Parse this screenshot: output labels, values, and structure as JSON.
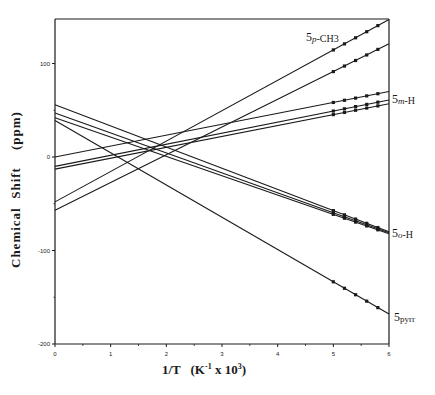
{
  "chart_data": {
    "type": "line",
    "title": "",
    "xlabel": "1/T   (K-1 x 10³)",
    "ylabel": "Chemical  Shift    (ppm)",
    "xlim": [
      0,
      6
    ],
    "ylim": [
      -200,
      150
    ],
    "x_ticks": [
      0,
      1,
      2,
      3,
      4,
      5,
      6
    ],
    "y_ticks": [
      -200,
      -100,
      0,
      100
    ],
    "grid": false,
    "legend": "inline labels at right edge",
    "series": [
      {
        "name": "5p-CH3 (a)",
        "group": "5p-CH3",
        "x": [
          0,
          6
        ],
        "y": [
          -48,
          147
        ],
        "markers_x": [
          5.0,
          5.2,
          5.4,
          5.6,
          5.8
        ]
      },
      {
        "name": "5p-CH3 (b)",
        "group": "5p-CH3",
        "x": [
          0,
          6
        ],
        "y": [
          -57,
          121
        ],
        "markers_x": [
          5.0,
          5.2,
          5.4,
          5.6,
          5.8
        ]
      },
      {
        "name": "5m-H (a)",
        "group": "5m-H",
        "x": [
          0,
          6
        ],
        "y": [
          0,
          70
        ],
        "markers_x": [
          5.0,
          5.2,
          5.4,
          5.6,
          5.8
        ]
      },
      {
        "name": "5m-H (b)",
        "group": "5m-H",
        "x": [
          0,
          6
        ],
        "y": [
          -10,
          61
        ],
        "markers_x": [
          5.0,
          5.2,
          5.4,
          5.6,
          5.8
        ]
      },
      {
        "name": "5m-H (c)",
        "group": "5m-H",
        "x": [
          0,
          6
        ],
        "y": [
          -13,
          57
        ],
        "markers_x": [
          5.0,
          5.2,
          5.4,
          5.6,
          5.8
        ]
      },
      {
        "name": "5o-H (a)",
        "group": "5o-H",
        "x": [
          0,
          6
        ],
        "y": [
          56,
          -80
        ],
        "markers_x": [
          5.0,
          5.2,
          5.4,
          5.6,
          5.8
        ]
      },
      {
        "name": "5o-H (b)",
        "group": "5o-H",
        "x": [
          0,
          6
        ],
        "y": [
          47,
          -81
        ],
        "markers_x": [
          5.0,
          5.2,
          5.4,
          5.6,
          5.8
        ]
      },
      {
        "name": "5o-H (c)",
        "group": "5o-H",
        "x": [
          0,
          6
        ],
        "y": [
          42,
          -82
        ],
        "markers_x": [
          5.0,
          5.2,
          5.4,
          5.6,
          5.8
        ]
      },
      {
        "name": "5pyrr",
        "group": "5pyrr",
        "x": [
          0,
          6
        ],
        "y": [
          39,
          -168
        ],
        "markers_x": [
          5.0,
          5.2,
          5.4,
          5.6,
          5.8
        ]
      }
    ],
    "annotations": [
      {
        "text": "5p-CH3",
        "num": "5",
        "sub": "p",
        "rest": "-CH3",
        "x_px": 306,
        "y_px": 30
      },
      {
        "text": "5m-H",
        "num": "5",
        "sub": "m",
        "rest": "-H",
        "x_px": 392,
        "y_px": 92
      },
      {
        "text": "5o-H",
        "num": "5",
        "sub": "o",
        "rest": "-H",
        "x_px": 392,
        "y_px": 226
      },
      {
        "text": "5pyrr",
        "num": "5",
        "sub": "pyrr",
        "rest": "",
        "x_px": 394,
        "y_px": 310
      }
    ]
  },
  "labels": {
    "ylabel": "Chemical  Shift    (ppm)",
    "xlabel": "1/T   (K-1 x 10³)"
  },
  "colors": {
    "line": "#1a1a1a",
    "background": "#ffffff"
  }
}
